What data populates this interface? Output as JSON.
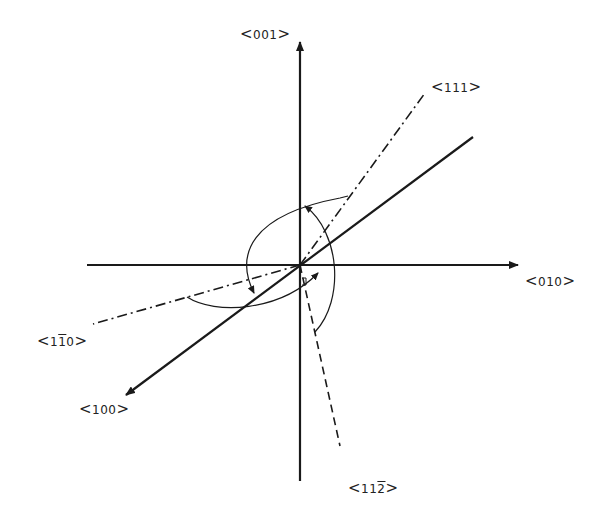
{
  "diagram": {
    "type": "crystallographic-directions",
    "stroke_color": "#1a1a1a",
    "background": "#ffffff",
    "origin": [
      300,
      265
    ],
    "axes": [
      {
        "id": "001",
        "label": "001",
        "style": "solid-arrow",
        "from": [
          300,
          481
        ],
        "to": [
          300,
          40
        ]
      },
      {
        "id": "010",
        "label": "010",
        "style": "solid-arrow",
        "from": [
          87,
          265
        ],
        "to": [
          520,
          265
        ]
      },
      {
        "id": "100",
        "label": "100",
        "style": "solid-arrow",
        "from": [
          473,
          137
        ],
        "to": [
          124,
          396
        ]
      }
    ],
    "directions": [
      {
        "id": "111",
        "label": "111",
        "style": "dash-dot",
        "from": [
          300,
          265
        ],
        "to": [
          425,
          93
        ]
      },
      {
        "id": "1-10",
        "label": "1",
        "label_bar": "1",
        "label_tail": "0",
        "style": "dash-dot",
        "from": [
          300,
          265
        ],
        "to": [
          93,
          324
        ]
      },
      {
        "id": "11-2",
        "label_head": "11",
        "label_bar": "2",
        "style": "dashed",
        "from": [
          300,
          265
        ],
        "to": [
          340,
          446
        ]
      }
    ],
    "labels": {
      "l001": "001",
      "l111": "111",
      "l010": "010",
      "l1b10_a": "1",
      "l1b10_b": "1",
      "l1b10_c": "0",
      "l100": "100",
      "l112b_a": "11",
      "l112b_b": "2",
      "open": "<",
      "close": ">"
    }
  }
}
